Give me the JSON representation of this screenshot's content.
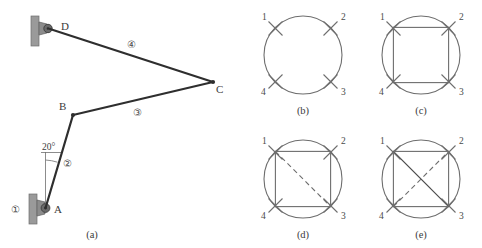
{
  "figure": {
    "background": "#ffffff",
    "ink": "#3b3b3b",
    "line_color": "#2e2e2e",
    "thin_color": "#6e6e6e",
    "bracket_fill": "#9a9a9a",
    "pivot_fill": "#5f5f5f"
  },
  "panel_a": {
    "caption": "(a)",
    "joints": [
      {
        "id": "A",
        "label": "A",
        "x": 46,
        "y": 208,
        "type": "ground-pivot"
      },
      {
        "id": "B",
        "label": "B",
        "x": 73,
        "y": 115,
        "type": "pin-joint"
      },
      {
        "id": "C",
        "label": "C",
        "x": 213,
        "y": 82,
        "type": "pin-joint"
      },
      {
        "id": "D",
        "label": "D",
        "x": 50,
        "y": 28,
        "type": "ground-pivot"
      }
    ],
    "links": [
      {
        "number": "①",
        "label": "1",
        "from": "ground",
        "to": "ground",
        "label_x": 16,
        "label_y": 209
      },
      {
        "number": "②",
        "label": "2",
        "from": "A",
        "to": "B",
        "label_x": 68,
        "label_y": 163
      },
      {
        "number": "③",
        "label": "3",
        "from": "B",
        "to": "C",
        "label_x": 138,
        "label_y": 112
      },
      {
        "number": "④",
        "label": "4",
        "from": "C",
        "to": "D",
        "label_x": 132,
        "label_y": 44
      }
    ],
    "angle": {
      "value": "20°",
      "at_joint": "A",
      "from": "vertical",
      "to_link": "2"
    }
  },
  "panel_b": {
    "caption": "(b)",
    "kind": "circle-with-tick-marks",
    "positions": [
      "1",
      "2",
      "3",
      "4"
    ],
    "square_edges": [],
    "solid_diagonals": [],
    "dashed_diagonals": []
  },
  "panel_c": {
    "caption": "(c)",
    "kind": "circle-with-inscribed-square",
    "positions": [
      "1",
      "2",
      "3",
      "4"
    ],
    "square_edges": [
      [
        "1",
        "2"
      ],
      [
        "2",
        "3"
      ],
      [
        "3",
        "4"
      ],
      [
        "4",
        "1"
      ]
    ],
    "solid_diagonals": [],
    "dashed_diagonals": []
  },
  "panel_d": {
    "caption": "(d)",
    "kind": "circle-square-one-dashed-diagonal",
    "positions": [
      "1",
      "2",
      "3",
      "4"
    ],
    "square_edges": [
      [
        "1",
        "2"
      ],
      [
        "2",
        "3"
      ],
      [
        "3",
        "4"
      ],
      [
        "4",
        "1"
      ]
    ],
    "solid_diagonals": [],
    "dashed_diagonals": [
      [
        "1",
        "3"
      ]
    ]
  },
  "panel_e": {
    "caption": "(e)",
    "kind": "circle-square-both-diagonals",
    "positions": [
      "1",
      "2",
      "3",
      "4"
    ],
    "square_edges": [
      [
        "1",
        "2"
      ],
      [
        "2",
        "3"
      ],
      [
        "3",
        "4"
      ],
      [
        "4",
        "1"
      ]
    ],
    "solid_diagonals": [
      [
        "1",
        "3"
      ]
    ],
    "dashed_diagonals": [
      [
        "4",
        "2"
      ]
    ]
  }
}
